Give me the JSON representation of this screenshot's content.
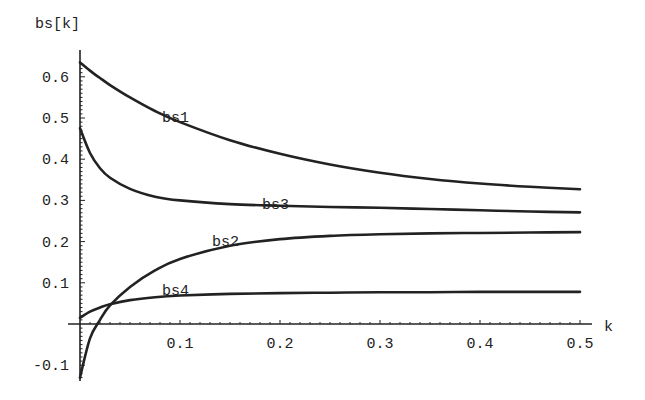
{
  "chart_data": {
    "type": "line",
    "title": "",
    "xlabel": "k",
    "ylabel": "bs[k]",
    "xlim": [
      0,
      0.5
    ],
    "ylim": [
      -0.13,
      0.65
    ],
    "grid": false,
    "legend": "inline curve labels",
    "x_ticks": [
      "0.1",
      "0.2",
      "0.3",
      "0.4",
      "0.5"
    ],
    "y_ticks": [
      "-0.1",
      "0.1",
      "0.2",
      "0.3",
      "0.4",
      "0.5",
      "0.6"
    ],
    "x": [
      0.0,
      0.01,
      0.02,
      0.03,
      0.05,
      0.075,
      0.1,
      0.15,
      0.2,
      0.25,
      0.3,
      0.35,
      0.4,
      0.45,
      0.5
    ],
    "series": [
      {
        "name": "bs1",
        "label_at": [
          0.1,
          0.5
        ],
        "values": [
          0.635,
          0.615,
          0.597,
          0.58,
          0.55,
          0.517,
          0.49,
          0.446,
          0.413,
          0.387,
          0.367,
          0.352,
          0.341,
          0.333,
          0.327
        ]
      },
      {
        "name": "bs3",
        "label_at": [
          0.2,
          0.29
        ],
        "values": [
          0.475,
          0.415,
          0.378,
          0.355,
          0.328,
          0.309,
          0.3,
          0.291,
          0.287,
          0.284,
          0.282,
          0.279,
          0.276,
          0.273,
          0.271
        ]
      },
      {
        "name": "bs2",
        "label_at": [
          0.15,
          0.2
        ],
        "values": [
          -0.13,
          -0.035,
          0.01,
          0.045,
          0.09,
          0.13,
          0.158,
          0.19,
          0.206,
          0.214,
          0.218,
          0.22,
          0.221,
          0.222,
          0.223
        ]
      },
      {
        "name": "bs4",
        "label_at": [
          0.1,
          0.08
        ],
        "values": [
          0.015,
          0.03,
          0.04,
          0.048,
          0.058,
          0.065,
          0.069,
          0.073,
          0.075,
          0.076,
          0.077,
          0.077,
          0.078,
          0.078,
          0.078
        ]
      }
    ]
  },
  "axes": {
    "y_title": "bs[k]",
    "x_title": "k"
  }
}
